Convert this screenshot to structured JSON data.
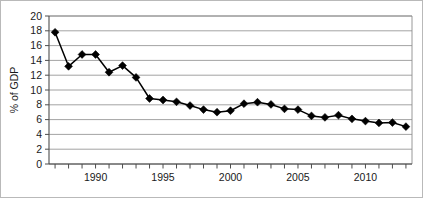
{
  "chart_data": {
    "type": "line",
    "title": "",
    "subtitle": "",
    "xlabel": "",
    "ylabel": "% of GDP",
    "xlim": [
      1987.2,
      1913.9
    ],
    "ylim": [
      0,
      20
    ],
    "ytick_step": 2,
    "yticks": [
      0,
      2,
      4,
      6,
      8,
      10,
      12,
      14,
      16,
      18,
      20
    ],
    "ytick_labels": [
      "0",
      "2",
      "4",
      "6",
      "8",
      "10",
      "12",
      "14",
      "16",
      "18",
      "20"
    ],
    "xticks": [
      1987.5,
      1988.5,
      1989.5,
      1990.5,
      1991.5,
      1992.5,
      1993.5,
      1994.5,
      1995.5,
      1996.5,
      1997.5,
      1998.5,
      1999.5,
      2000.5,
      2001.5,
      2002.5,
      2003.5,
      2004.5,
      2005.5,
      2006.5,
      2007.5,
      2008.5,
      2009.5,
      2010.5,
      2011.5,
      2012.5,
      2013.5
    ],
    "xtick_labels": [
      "1990",
      "1995",
      "2000",
      "2005",
      "2010"
    ],
    "xtick_label_values": [
      1990,
      1995,
      2000,
      2005,
      2010
    ],
    "grid": "horizontal",
    "legend": "none",
    "marker": "diamond",
    "line_color": "#000000",
    "marker_color": "#000000",
    "grid_color": "#8c8c8c",
    "axis_color": "#4d4d4d",
    "background_color": "#ffffff",
    "border_color": "#b9b9b9",
    "x": [
      1987.5,
      1988.5,
      1989.5,
      1990.5,
      1991.5,
      1992.5,
      1993.5,
      1994.5,
      1995.5,
      1996.5,
      1997.5,
      1998.5,
      1999.5,
      2000.5,
      2001.5,
      2002.5,
      2003.5,
      2004.5,
      2005.5,
      2006.5,
      2007.5,
      2008.5,
      2009.5,
      2010.5,
      2011.5,
      2012.5,
      2013.5
    ],
    "values": [
      17.8,
      13.2,
      14.8,
      14.8,
      12.4,
      13.3,
      11.7,
      8.85,
      8.65,
      8.4,
      7.9,
      7.35,
      7.0,
      7.2,
      8.15,
      8.35,
      8.05,
      7.45,
      7.35,
      6.5,
      6.3,
      6.6,
      6.1,
      5.8,
      5.55,
      5.6,
      5.05
    ],
    "series": [
      {
        "name": "% of GDP",
        "values": [
          17.8,
          13.2,
          14.8,
          14.8,
          12.4,
          13.3,
          11.7,
          8.85,
          8.65,
          8.4,
          7.9,
          7.35,
          7.0,
          7.2,
          8.15,
          8.35,
          8.05,
          7.45,
          7.35,
          6.5,
          6.3,
          6.6,
          6.1,
          5.8,
          5.55,
          5.6,
          5.05
        ]
      }
    ]
  }
}
